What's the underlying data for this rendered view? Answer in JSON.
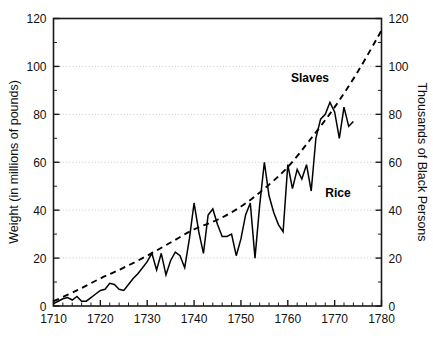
{
  "chart_data": {
    "type": "line",
    "title": "",
    "subtitle": "",
    "xlabel": "",
    "ylabel": "Weight (in millions of pounds)",
    "y2label": "Thousands of Black Persons",
    "xlim": [
      1710,
      1780
    ],
    "ylim": [
      0,
      120
    ],
    "y2lim": [
      0,
      120
    ],
    "grid": true,
    "grid_axis": "y",
    "grid_values": [
      20,
      40,
      60,
      80,
      100
    ],
    "legend_position": "inline-annotations",
    "x_ticks": [
      1710,
      1720,
      1730,
      1740,
      1750,
      1760,
      1770,
      1780
    ],
    "x_tick_labels": [
      "1710",
      "1720",
      "1730",
      "1740",
      "1750",
      "1760",
      "1770",
      "1780"
    ],
    "x_minor_tick_step": 2,
    "y_ticks": [
      0,
      20,
      40,
      60,
      80,
      100,
      120
    ],
    "y_tick_labels": [
      "0",
      "20",
      "40",
      "60",
      "80",
      "100",
      "120"
    ],
    "y_minor_tick_step": 10,
    "y2_ticks": [
      0,
      20,
      40,
      60,
      80,
      100,
      120
    ],
    "y2_tick_labels": [
      "0",
      "20",
      "40",
      "60",
      "80",
      "100",
      "120"
    ],
    "series": [
      {
        "name": "Rice",
        "label": "Rice",
        "axis": "left",
        "style": "solid",
        "color": "#000000",
        "x": [
          1710,
          1711,
          1712,
          1713,
          1714,
          1715,
          1716,
          1717,
          1718,
          1719,
          1720,
          1721,
          1722,
          1723,
          1724,
          1725,
          1726,
          1727,
          1728,
          1729,
          1730,
          1731,
          1732,
          1733,
          1734,
          1735,
          1736,
          1737,
          1738,
          1739,
          1740,
          1741,
          1742,
          1743,
          1744,
          1745,
          1746,
          1747,
          1748,
          1749,
          1750,
          1751,
          1752,
          1753,
          1754,
          1755,
          1756,
          1757,
          1758,
          1759,
          1760,
          1761,
          1762,
          1763,
          1764,
          1765,
          1766,
          1767,
          1768,
          1769,
          1770,
          1771,
          1772,
          1773,
          1774
        ],
        "values": [
          1,
          2,
          3,
          3.5,
          2.5,
          4,
          2,
          2,
          3.5,
          5,
          6.5,
          7,
          9.5,
          9,
          7,
          6.5,
          9,
          11.5,
          13.5,
          16,
          18.5,
          22,
          15,
          22,
          13,
          19,
          22.5,
          21,
          16,
          28,
          43,
          31,
          22,
          38,
          40.5,
          34,
          29,
          29,
          30,
          21,
          28,
          38,
          43,
          20,
          42,
          60,
          46,
          39,
          34,
          31,
          59,
          49,
          57,
          53,
          59,
          48,
          70,
          78,
          80,
          85,
          81,
          70,
          83,
          75,
          77
        ]
      },
      {
        "name": "Slaves",
        "label": "Slaves",
        "axis": "right",
        "style": "dashed",
        "color": "#000000",
        "x": [
          1710,
          1715,
          1720,
          1725,
          1730,
          1735,
          1740,
          1745,
          1750,
          1755,
          1760,
          1765,
          1770,
          1775,
          1780
        ],
        "values": [
          2,
          6.5,
          11.5,
          16,
          21,
          26.5,
          32,
          36,
          41.5,
          49,
          58,
          70,
          83,
          98,
          115
        ]
      }
    ],
    "annotations": [
      {
        "text": "Slaves",
        "x": 1762,
        "y": 95,
        "series": "Slaves"
      },
      {
        "text": "Rice",
        "x": 1767,
        "y": 50,
        "series": "Rice"
      }
    ]
  },
  "colors": {
    "axis": "#1a1a1a",
    "grid": "#c8c8c8",
    "series": "#000000",
    "background": "#ffffff",
    "text": "#111111"
  }
}
